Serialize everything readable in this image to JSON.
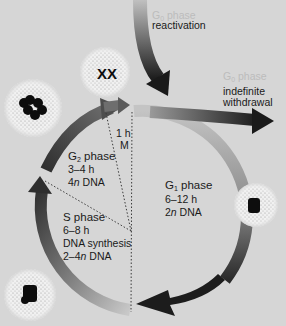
{
  "diagram": {
    "type": "cell-cycle",
    "colors": {
      "background": "#d6d6d6",
      "cycle_arrow_light": "#b9b9b9",
      "cycle_arrow_dark": "#3a3a3a",
      "text": "#1a1a1a",
      "faint_text": "#bcbcbc",
      "nucleus_halo": "#f2f2f2",
      "chromatin": "#0d0d0d"
    },
    "phases": [
      {
        "id": "G1",
        "name_prefix": "G",
        "name_sub": "1",
        "name_suffix": " phase",
        "duration": "6–12 h",
        "dna_prefix": "2",
        "dna_italic": "n",
        "dna_suffix": " DNA"
      },
      {
        "id": "S",
        "name": "S phase",
        "duration": "6–8 h",
        "detail": "DNA synthesis",
        "dna_prefix": "2–4",
        "dna_italic": "n",
        "dna_suffix": " DNA"
      },
      {
        "id": "G2",
        "name_prefix": "G",
        "name_sub": "2",
        "name_suffix": " phase",
        "duration": "3–4 h",
        "dna_prefix": "4",
        "dna_italic": "n",
        "dna_suffix": " DNA"
      },
      {
        "id": "M",
        "name": "M",
        "duration": "1 h"
      }
    ],
    "g0": {
      "reactivation": {
        "faint_label_prefix": "G",
        "faint_label_sub": "0",
        "faint_label_suffix": " phase",
        "label": "reactivation"
      },
      "withdrawal": {
        "faint_label_prefix": "G",
        "faint_label_sub": "0",
        "faint_label_suffix": " phase",
        "label_line1": "indefinite",
        "label_line2": "withdrawal"
      }
    },
    "nuclei": [
      {
        "stage": "mitosis",
        "content": "paired chromosomes"
      },
      {
        "stage": "G2",
        "content": "condensed chromatin clusters"
      },
      {
        "stage": "G1",
        "content": "small chromatin mass"
      },
      {
        "stage": "S",
        "content": "chromatin mass"
      }
    ]
  }
}
